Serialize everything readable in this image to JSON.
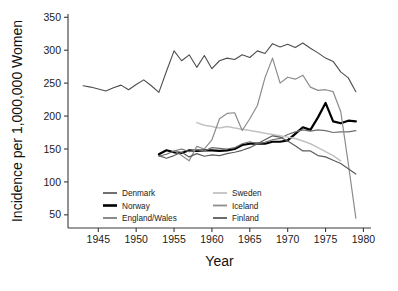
{
  "chart_data": {
    "type": "line",
    "title": "",
    "xlabel": "Year",
    "ylabel": "Incidence per 1,000,000 Women",
    "xlim": [
      1941,
      1981
    ],
    "ylim": [
      30,
      355
    ],
    "xticks": [
      1945,
      1950,
      1955,
      1960,
      1965,
      1970,
      1975,
      1980
    ],
    "yticks": [
      50,
      100,
      150,
      200,
      250,
      300,
      350
    ],
    "grid": false,
    "legend_position": "inside-bottom-left",
    "series": [
      {
        "name": "Denmark",
        "color": "#4d4d4d",
        "width": 1.1,
        "x": [
          1943,
          1944,
          1945,
          1946,
          1947,
          1948,
          1949,
          1950,
          1951,
          1952,
          1953,
          1954,
          1955,
          1956,
          1957,
          1958,
          1959,
          1960,
          1961,
          1962,
          1963,
          1964,
          1965,
          1966,
          1967,
          1968,
          1969,
          1970,
          1971,
          1972,
          1973,
          1974,
          1975,
          1976,
          1977,
          1978,
          1979
        ],
        "values": [
          246,
          244,
          241,
          238,
          243,
          247,
          240,
          248,
          255,
          246,
          236,
          268,
          299,
          284,
          293,
          274,
          292,
          272,
          284,
          288,
          286,
          293,
          289,
          299,
          295,
          310,
          305,
          309,
          304,
          311,
          303,
          296,
          288,
          283,
          267,
          258,
          237
        ]
      },
      {
        "name": "Norway",
        "color": "#000000",
        "width": 2.2,
        "x": [
          1953,
          1954,
          1955,
          1956,
          1957,
          1958,
          1959,
          1960,
          1961,
          1962,
          1963,
          1964,
          1965,
          1966,
          1967,
          1968,
          1969,
          1970,
          1971,
          1972,
          1973,
          1974,
          1975,
          1976,
          1977,
          1978,
          1979
        ],
        "values": [
          142,
          148,
          145,
          144,
          148,
          147,
          148,
          148,
          147,
          148,
          150,
          156,
          158,
          158,
          158,
          161,
          161,
          163,
          173,
          183,
          179,
          198,
          220,
          192,
          189,
          193,
          192
        ]
      },
      {
        "name": "England/Wales",
        "color": "#6e6e6e",
        "width": 1.2,
        "x": [
          1953,
          1954,
          1955,
          1956,
          1957,
          1958,
          1959,
          1960,
          1961,
          1962,
          1963,
          1964,
          1965,
          1966,
          1967,
          1968,
          1969,
          1970,
          1971,
          1972,
          1973,
          1974,
          1975,
          1976,
          1977,
          1978,
          1979
        ],
        "values": [
          139,
          142,
          147,
          150,
          146,
          149,
          147,
          152,
          151,
          150,
          152,
          158,
          161,
          158,
          160,
          164,
          166,
          172,
          176,
          179,
          177,
          179,
          178,
          175,
          176,
          176,
          178
        ]
      },
      {
        "name": "Sweden",
        "color": "#c2c2c2",
        "width": 1.5,
        "x": [
          1958,
          1959,
          1960,
          1961,
          1962,
          1963,
          1964,
          1965,
          1966,
          1967,
          1968,
          1969,
          1970,
          1971,
          1972,
          1973,
          1974,
          1975,
          1976,
          1977
        ],
        "values": [
          190,
          186,
          184,
          182,
          184,
          182,
          180,
          178,
          176,
          174,
          172,
          170,
          168,
          166,
          162,
          158,
          152,
          146,
          140,
          132
        ]
      },
      {
        "name": "Iceland",
        "color": "#8c8c8c",
        "width": 1.2,
        "x": [
          1955,
          1956,
          1957,
          1958,
          1959,
          1960,
          1961,
          1962,
          1963,
          1964,
          1965,
          1966,
          1967,
          1968,
          1969,
          1970,
          1971,
          1972,
          1973,
          1974,
          1975,
          1976,
          1977,
          1978,
          1979
        ],
        "values": [
          148,
          140,
          132,
          154,
          150,
          164,
          196,
          204,
          205,
          178,
          196,
          216,
          258,
          288,
          250,
          259,
          256,
          262,
          244,
          239,
          240,
          237,
          207,
          128,
          45
        ]
      },
      {
        "name": "Finland",
        "color": "#5c5c5c",
        "width": 1.2,
        "x": [
          1953,
          1954,
          1955,
          1956,
          1957,
          1958,
          1959,
          1960,
          1961,
          1962,
          1963,
          1964,
          1965,
          1966,
          1967,
          1968,
          1969,
          1970,
          1971,
          1972,
          1973,
          1974,
          1975,
          1976,
          1977,
          1978,
          1979
        ],
        "values": [
          140,
          136,
          140,
          145,
          138,
          143,
          139,
          141,
          140,
          143,
          145,
          148,
          152,
          158,
          164,
          170,
          168,
          162,
          155,
          147,
          147,
          140,
          138,
          133,
          128,
          120,
          112
        ]
      }
    ]
  },
  "axes": {
    "ylabel": "Incidence per 1,000,000 Women",
    "xlabel": "Year",
    "xtick_labels": [
      "1945",
      "1950",
      "1955",
      "1960",
      "1965",
      "1970",
      "1975",
      "1980"
    ],
    "ytick_labels": [
      "50",
      "100",
      "150",
      "200",
      "250",
      "300",
      "350"
    ]
  },
  "legend": {
    "column_left": [
      {
        "label": "Denmark",
        "color": "#4d4d4d",
        "width": 1.6
      },
      {
        "label": "Norway",
        "color": "#000000",
        "width": 2.6
      },
      {
        "label": "England/Wales",
        "color": "#6e6e6e",
        "width": 1.6
      }
    ],
    "column_right": [
      {
        "label": "Sweden",
        "color": "#c2c2c2",
        "width": 1.8
      },
      {
        "label": "Iceland",
        "color": "#8c8c8c",
        "width": 1.8
      },
      {
        "label": "Finland",
        "color": "#5c5c5c",
        "width": 1.8
      }
    ]
  }
}
